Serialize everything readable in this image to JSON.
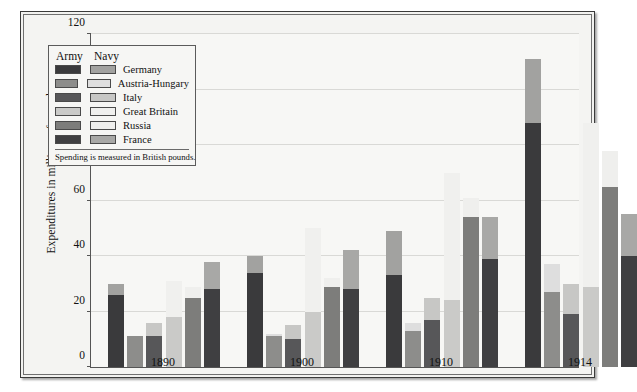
{
  "chart_data": {
    "type": "bar",
    "subtype": "grouped-stacked",
    "title": "",
    "xlabel": "",
    "ylabel": "Expenditures in millions of pounds",
    "ylim": [
      0,
      120
    ],
    "ytick_step": 20,
    "yticks": [
      "120",
      "100",
      "80",
      "60",
      "40",
      "20",
      "0"
    ],
    "grid": true,
    "categories": [
      "1890",
      "1900",
      "1910",
      "1914"
    ],
    "stack_segments": [
      "Army",
      "Navy"
    ],
    "legend_position": "inside-top-left",
    "legend_note": "Spending is measured in British pounds.",
    "legend_headers": [
      "Army",
      "Navy"
    ],
    "countries": [
      {
        "name": "Germany",
        "army_color": "#3a3a3c",
        "navy_color": "#a2a2a0",
        "values": [
          {
            "year": "1890",
            "army": 26,
            "navy": 4,
            "total": 30
          },
          {
            "year": "1900",
            "army": 34,
            "navy": 6,
            "total": 40
          },
          {
            "year": "1910",
            "army": 33,
            "navy": 16,
            "total": 49
          },
          {
            "year": "1914",
            "army": 88,
            "navy": 23,
            "total": 111
          }
        ]
      },
      {
        "name": "Austria-Hungary",
        "army_color": "#8d8d8b",
        "navy_color": "#dedede",
        "values": [
          {
            "year": "1890",
            "army": 11,
            "navy": 0,
            "total": 11
          },
          {
            "year": "1900",
            "army": 11,
            "navy": 1,
            "total": 12
          },
          {
            "year": "1910",
            "army": 13,
            "navy": 3,
            "total": 16
          },
          {
            "year": "1914",
            "army": 27,
            "navy": 10,
            "total": 37
          }
        ]
      },
      {
        "name": "Italy",
        "army_color": "#575759",
        "navy_color": "#c7c7c5",
        "values": [
          {
            "year": "1890",
            "army": 11,
            "navy": 5,
            "total": 16
          },
          {
            "year": "1900",
            "army": 10,
            "navy": 5,
            "total": 15
          },
          {
            "year": "1910",
            "army": 17,
            "navy": 8,
            "total": 25
          },
          {
            "year": "1914",
            "army": 19,
            "navy": 11,
            "total": 30
          }
        ]
      },
      {
        "name": "Great Britain",
        "army_color": "#cacac8",
        "navy_color": "#f0f0ee",
        "values": [
          {
            "year": "1890",
            "army": 18,
            "navy": 13,
            "total": 31
          },
          {
            "year": "1900",
            "army": 20,
            "navy": 30,
            "total": 50
          },
          {
            "year": "1910",
            "army": 24,
            "navy": 46,
            "total": 70
          },
          {
            "year": "1914",
            "army": 29,
            "navy": 59,
            "total": 88
          }
        ]
      },
      {
        "name": "Russia",
        "army_color": "#7d7d7b",
        "navy_color": "#efefed",
        "values": [
          {
            "year": "1890",
            "army": 25,
            "navy": 4,
            "total": 29
          },
          {
            "year": "1900",
            "army": 29,
            "navy": 3,
            "total": 32
          },
          {
            "year": "1910",
            "army": 54,
            "navy": 7,
            "total": 61
          },
          {
            "year": "1914",
            "army": 65,
            "navy": 13,
            "total": 78
          }
        ]
      },
      {
        "name": "France",
        "army_color": "#3f3f41",
        "navy_color": "#a8a8a6",
        "values": [
          {
            "year": "1890",
            "army": 28,
            "navy": 10,
            "total": 38
          },
          {
            "year": "1900",
            "army": 28,
            "navy": 14,
            "total": 42
          },
          {
            "year": "1910",
            "army": 39,
            "navy": 15,
            "total": 54
          },
          {
            "year": "1914",
            "army": 40,
            "navy": 15,
            "total": 55
          }
        ]
      }
    ]
  }
}
